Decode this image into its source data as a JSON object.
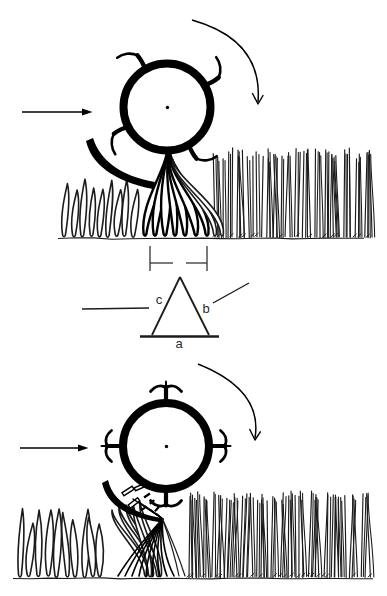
{
  "document": {
    "kind": "scanned-technical-line-diagram",
    "figures": {
      "top": "rotor-drum-with-hook-tines-gathering-standing-crop",
      "bottom": "rotor-drum-with-flared-tines-and-deflector-shoe-chopping-crop"
    }
  },
  "colors": {
    "paper": "#ffffff",
    "ink": "#000000",
    "crop_ink": "#1b1b1b",
    "label_ink": "#2a2a2a"
  },
  "labels": {
    "triangle_a": "a",
    "triangle_b": "b",
    "triangle_c": "c"
  },
  "icons": {
    "travel_arrow": "right-arrow",
    "rotation_arrow": "clockwise-arc-arrow"
  }
}
